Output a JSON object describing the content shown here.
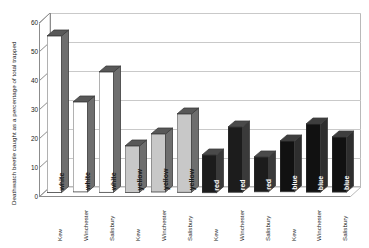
{
  "chart_data": {
    "type": "bar",
    "title": "",
    "xlabel": "",
    "ylabel": "Deathwatch beetle caught as a percentage of total trapped",
    "ylim": [
      0,
      60
    ],
    "yticks": [
      0,
      10,
      20,
      30,
      40,
      50,
      60
    ],
    "grid": true,
    "legend": "none",
    "three_d": true,
    "categories": [
      "Kew",
      "Winchester",
      "Salisbury",
      "Kew",
      "Winchester",
      "Salisbury",
      "Kew",
      "Winchester",
      "Salisbury",
      "Kew",
      "Winchester",
      "Salisbury"
    ],
    "group_labels": [
      "white",
      "white",
      "white",
      "yellow",
      "yellow",
      "yellow",
      "red",
      "red",
      "red",
      "blue",
      "blue",
      "blue"
    ],
    "values": [
      54,
      31,
      41.5,
      16,
      20,
      27,
      13,
      22.5,
      12,
      17.5,
      23.5,
      19
    ],
    "bars": [
      {
        "site": "Kew",
        "trap_colour": "white",
        "value": 54,
        "fill": "#ffffff",
        "side": "#6e6e6e",
        "top": "#585858",
        "label_colour": "#1a1a1a"
      },
      {
        "site": "Winchester",
        "trap_colour": "white",
        "value": 31,
        "fill": "#ffffff",
        "side": "#6e6e6e",
        "top": "#585858",
        "label_colour": "#1a1a1a"
      },
      {
        "site": "Salisbury",
        "trap_colour": "white",
        "value": 41.5,
        "fill": "#ffffff",
        "side": "#6e6e6e",
        "top": "#585858",
        "label_colour": "#1a1a1a"
      },
      {
        "site": "Kew",
        "trap_colour": "yellow",
        "value": 16,
        "fill": "#c8c8c8",
        "side": "#6e6e6e",
        "top": "#585858",
        "label_colour": "#1a1a1a"
      },
      {
        "site": "Winchester",
        "trap_colour": "yellow",
        "value": 20,
        "fill": "#c8c8c8",
        "side": "#6e6e6e",
        "top": "#585858",
        "label_colour": "#1a1a1a"
      },
      {
        "site": "Salisbury",
        "trap_colour": "yellow",
        "value": 27,
        "fill": "#c8c8c8",
        "side": "#6e6e6e",
        "top": "#585858",
        "label_colour": "#1a1a1a"
      },
      {
        "site": "Kew",
        "trap_colour": "red",
        "value": 13,
        "fill": "#1c1c1c",
        "side": "#3a3a3a",
        "top": "#4a4a4a",
        "label_colour": "#ffffff"
      },
      {
        "site": "Winchester",
        "trap_colour": "red",
        "value": 22.5,
        "fill": "#1c1c1c",
        "side": "#3a3a3a",
        "top": "#4a4a4a",
        "label_colour": "#ffffff"
      },
      {
        "site": "Salisbury",
        "trap_colour": "red",
        "value": 12,
        "fill": "#1c1c1c",
        "side": "#3a3a3a",
        "top": "#4a4a4a",
        "label_colour": "#ffffff"
      },
      {
        "site": "Kew",
        "trap_colour": "blue",
        "value": 17.5,
        "fill": "#111111",
        "side": "#2e2e2e",
        "top": "#3e3e3e",
        "label_colour": "#ffffff"
      },
      {
        "site": "Winchester",
        "trap_colour": "blue",
        "value": 23.5,
        "fill": "#111111",
        "side": "#2e2e2e",
        "top": "#3e3e3e",
        "label_colour": "#ffffff"
      },
      {
        "site": "Salisbury",
        "trap_colour": "blue",
        "value": 19,
        "fill": "#111111",
        "side": "#2e2e2e",
        "top": "#3e3e3e",
        "label_colour": "#ffffff"
      }
    ],
    "colors": {
      "gridline": "#c9c9c9",
      "axis": "#8c8c8c",
      "plot_background": "#ffffff",
      "floor": "#ffffff",
      "text": "#1a1a1a"
    }
  }
}
